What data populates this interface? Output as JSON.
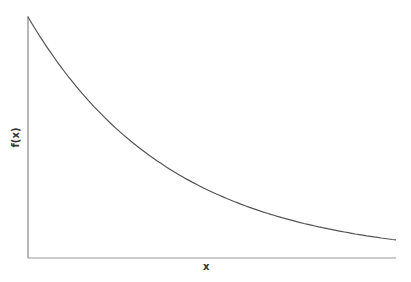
{
  "chart_data": {
    "type": "line",
    "title": "",
    "xlabel": "x",
    "ylabel": "f(x)",
    "grid": false,
    "legend": null,
    "x": [
      0,
      0.1,
      0.2,
      0.3,
      0.4,
      0.5,
      0.6,
      0.7,
      0.8,
      0.9,
      1.0
    ],
    "series": [
      {
        "name": "f(x)",
        "values": [
          1.0,
          0.771,
          0.595,
          0.458,
          0.353,
          0.273,
          0.21,
          0.162,
          0.125,
          0.096,
          0.075
        ]
      }
    ],
    "xlim": [
      0,
      1
    ],
    "ylim": [
      0,
      1
    ],
    "color": "#555555"
  }
}
